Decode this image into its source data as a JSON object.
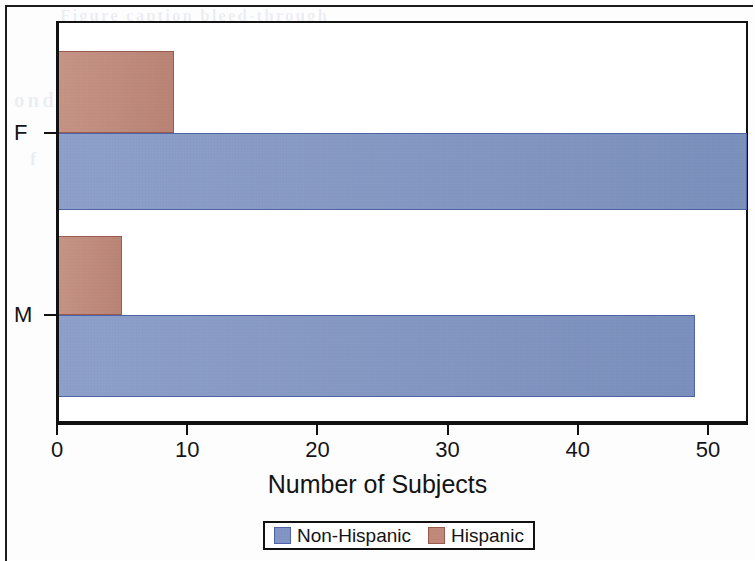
{
  "figure": {
    "kind": "horizontal-grouped-bar-chart",
    "ghost_text": {
      "line1": "Figure caption bleed-through",
      "line2": "ond of",
      "line3": "f",
      "line4": "show-through"
    }
  },
  "chart_data": {
    "type": "bar",
    "orientation": "horizontal",
    "title": "",
    "xlabel": "Number of Subjects",
    "ylabel": "",
    "categories": [
      "F",
      "M"
    ],
    "series": [
      {
        "name": "Non-Hispanic",
        "color": "#8095c4",
        "border_color": "#4f63a8",
        "values": [
          53,
          49
        ]
      },
      {
        "name": "Hispanic",
        "color": "#c08878",
        "border_color": "#9a5a4c",
        "values": [
          9,
          5
        ]
      }
    ],
    "xlim": [
      0,
      53
    ],
    "xticks": [
      0,
      10,
      20,
      30,
      40,
      50
    ],
    "xtick_labels": [
      "0",
      "10",
      "20",
      "30",
      "40",
      "50"
    ],
    "ytick_labels": [
      "F",
      "M"
    ],
    "grid": false,
    "legend_position": "bottom",
    "legend_entries": [
      "Non-Hispanic",
      "Hispanic"
    ]
  },
  "axis": {
    "x_title": "Number of Subjects",
    "x_tick_labels": [
      "0",
      "10",
      "20",
      "30",
      "40",
      "50"
    ],
    "y_tick_labels": [
      "F",
      "M"
    ]
  },
  "legend": {
    "items": [
      {
        "label": "Non-Hispanic",
        "swatch": "blue-swatch-icon"
      },
      {
        "label": "Hispanic",
        "swatch": "red-swatch-icon"
      }
    ]
  }
}
